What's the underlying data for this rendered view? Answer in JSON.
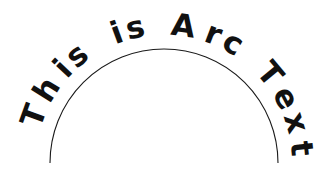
{
  "document": {
    "title": "Arc Text",
    "background_color": "#ffffff",
    "width": 330,
    "height": 178
  },
  "artwork": {
    "name": "arc-text-figure",
    "full_text": "This is Arc Text",
    "words": [
      "This",
      "is",
      "Arc",
      "Text"
    ],
    "text_color": "#111111",
    "font_weight": "bold",
    "font_size_px": 31,
    "arc": {
      "stroke_color": "#1a1a1a",
      "stroke_width_px": 1.1,
      "center_x": 164,
      "center_y": 163,
      "radius_px": 114,
      "start_angle_deg": 180,
      "end_angle_deg": 360,
      "shape": "semicircle-upper",
      "apex_x": 164,
      "apex_y": 49,
      "left_end_x": 50,
      "left_end_y": 163,
      "right_end_x": 278,
      "right_end_y": 163
    },
    "text_path": {
      "baseline_radius_px": 128,
      "start_angle_deg": 197,
      "end_angle_deg": 372,
      "letter_orientation": "tangent-outside",
      "direction": "clockwise"
    },
    "glyphs": [
      {
        "char": "T",
        "angle_deg": 200
      },
      {
        "char": "h",
        "angle_deg": 212
      },
      {
        "char": "i",
        "angle_deg": 223
      },
      {
        "char": "s",
        "angle_deg": 231
      },
      {
        "char": " ",
        "angle_deg": 240
      },
      {
        "char": "i",
        "angle_deg": 250
      },
      {
        "char": "s",
        "angle_deg": 258
      },
      {
        "char": " ",
        "angle_deg": 267
      },
      {
        "char": "A",
        "angle_deg": 278
      },
      {
        "char": "r",
        "angle_deg": 291
      },
      {
        "char": "c",
        "angle_deg": 300
      },
      {
        "char": " ",
        "angle_deg": 309
      },
      {
        "char": "T",
        "angle_deg": 320
      },
      {
        "char": "e",
        "angle_deg": 332
      },
      {
        "char": "x",
        "angle_deg": 343
      },
      {
        "char": "t",
        "angle_deg": 354
      }
    ]
  }
}
